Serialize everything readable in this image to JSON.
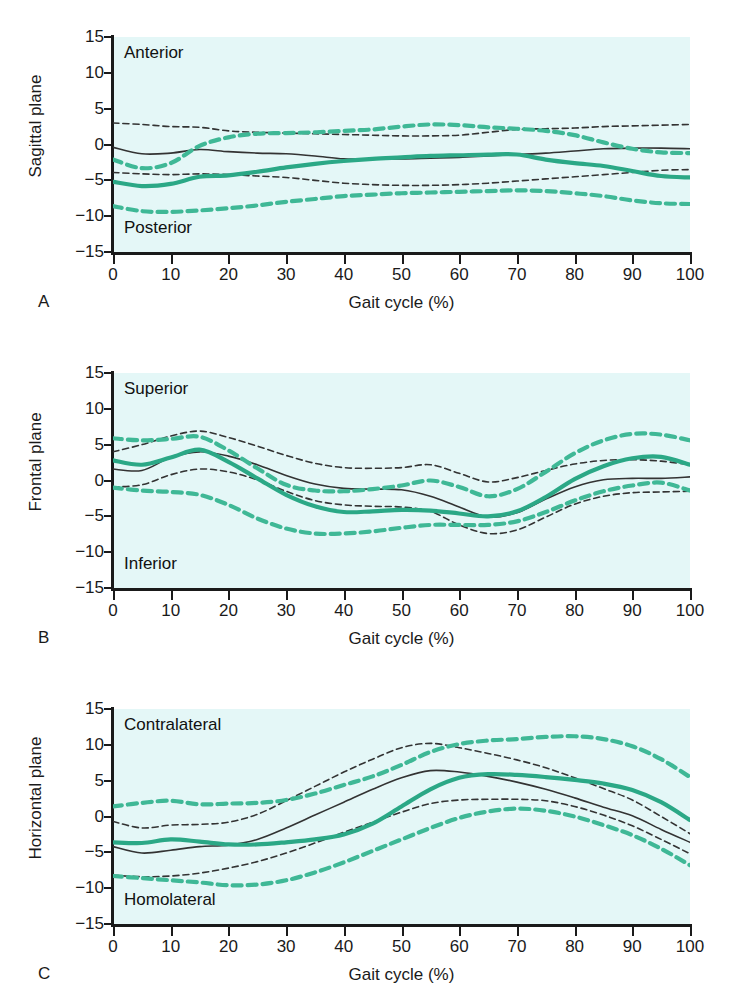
{
  "figure": {
    "xaxis_title": "Gait cycle (%)",
    "xticks": [
      0,
      10,
      20,
      30,
      40,
      50,
      60,
      70,
      80,
      90,
      100
    ],
    "yticks": [
      15,
      10,
      5,
      0,
      -5,
      -10,
      -15
    ],
    "ytick_labels": [
      "15",
      "10",
      "5",
      "0",
      "−5",
      "−10",
      "−15"
    ],
    "colors": {
      "plot_background": "#e4f7f7",
      "axis": "#1a1a1a",
      "normal_mean": "#333333",
      "normal_sd": "#333333",
      "patient_mean": "#2ba886",
      "patient_sd": "#3fb896"
    }
  },
  "panels": [
    {
      "letter": "A",
      "ylabel": "Sagittal plane",
      "corner_top": "Anterior",
      "corner_bottom": "Posterior",
      "xaxis_title": "Gait cycle (%)"
    },
    {
      "letter": "B",
      "ylabel": "Frontal plane",
      "corner_top": "Superior",
      "corner_bottom": "Inferior",
      "xaxis_title": "Gait cycle (%)"
    },
    {
      "letter": "C",
      "ylabel": "Horizontal plane",
      "corner_top": "Contralateral",
      "corner_bottom": "Homolateral",
      "xaxis_title": "Gait cycle (%)"
    }
  ],
  "chart_data": [
    {
      "type": "line",
      "panel": "A",
      "title": "Sagittal plane",
      "xlabel": "Gait cycle (%)",
      "ylabel": "Sagittal plane",
      "xlim": [
        0,
        100
      ],
      "ylim": [
        -15,
        15
      ],
      "grid": false,
      "legend": "none",
      "annotations": [
        "Anterior",
        "Posterior"
      ],
      "x": [
        0,
        5,
        10,
        15,
        20,
        25,
        30,
        35,
        40,
        45,
        50,
        55,
        60,
        65,
        70,
        75,
        80,
        85,
        90,
        95,
        100
      ],
      "series": [
        {
          "name": "normal-mean",
          "style": "solid",
          "color": "#333333",
          "values": [
            -0.4,
            -1.3,
            -1.2,
            -0.7,
            -1.0,
            -1.2,
            -1.3,
            -1.6,
            -2.0,
            -2.0,
            -2.0,
            -1.9,
            -1.8,
            -1.6,
            -1.4,
            -1.2,
            -0.9,
            -0.6,
            -0.5,
            -0.5,
            -0.6
          ]
        },
        {
          "name": "normal-sd-upper",
          "style": "dashed",
          "color": "#333333",
          "values": [
            3.0,
            2.8,
            2.5,
            2.4,
            1.9,
            1.7,
            1.6,
            1.5,
            1.4,
            1.3,
            1.2,
            1.2,
            1.3,
            1.7,
            2.1,
            2.2,
            2.3,
            2.5,
            2.6,
            2.7,
            2.8
          ]
        },
        {
          "name": "normal-sd-lower",
          "style": "dashed",
          "color": "#333333",
          "values": [
            -3.9,
            -4.1,
            -4.2,
            -4.1,
            -4.2,
            -4.4,
            -4.6,
            -5.0,
            -5.4,
            -5.6,
            -5.7,
            -5.7,
            -5.6,
            -5.4,
            -5.1,
            -4.8,
            -4.5,
            -4.2,
            -3.9,
            -3.6,
            -3.5
          ]
        },
        {
          "name": "patient-mean",
          "style": "solid",
          "color": "#2ba886",
          "values": [
            -5.2,
            -5.8,
            -5.5,
            -4.5,
            -4.3,
            -3.8,
            -3.2,
            -2.7,
            -2.3,
            -2.0,
            -1.8,
            -1.6,
            -1.5,
            -1.4,
            -1.4,
            -2.1,
            -2.6,
            -3.0,
            -3.7,
            -4.4,
            -4.6
          ]
        },
        {
          "name": "patient-sd-upper",
          "style": "dashed",
          "color": "#3fb896",
          "values": [
            -2.1,
            -3.3,
            -2.6,
            -0.2,
            1.0,
            1.5,
            1.6,
            1.7,
            1.9,
            2.1,
            2.5,
            2.8,
            2.7,
            2.4,
            2.2,
            1.9,
            1.3,
            0.3,
            -0.6,
            -1.1,
            -1.2
          ]
        },
        {
          "name": "patient-sd-lower",
          "style": "dashed",
          "color": "#3fb896",
          "values": [
            -8.6,
            -9.3,
            -9.4,
            -9.2,
            -8.9,
            -8.5,
            -8.0,
            -7.6,
            -7.2,
            -7.0,
            -6.8,
            -6.7,
            -6.6,
            -6.5,
            -6.4,
            -6.5,
            -6.8,
            -7.2,
            -7.8,
            -8.2,
            -8.3
          ]
        }
      ]
    },
    {
      "type": "line",
      "panel": "B",
      "title": "Frontal plane",
      "xlabel": "Gait cycle (%)",
      "ylabel": "Frontal plane",
      "xlim": [
        0,
        100
      ],
      "ylim": [
        -15,
        15
      ],
      "grid": false,
      "legend": "none",
      "annotations": [
        "Superior",
        "Inferior"
      ],
      "x": [
        0,
        5,
        10,
        15,
        20,
        25,
        30,
        35,
        40,
        45,
        50,
        55,
        60,
        65,
        70,
        75,
        80,
        85,
        90,
        95,
        100
      ],
      "series": [
        {
          "name": "normal-mean",
          "style": "solid",
          "color": "#333333",
          "values": [
            1.6,
            1.4,
            3.2,
            4.0,
            3.4,
            2.2,
            0.7,
            -0.5,
            -1.1,
            -1.2,
            -1.3,
            -2.2,
            -3.7,
            -5.1,
            -4.5,
            -2.6,
            -0.9,
            0.1,
            0.3,
            0.3,
            0.5
          ]
        },
        {
          "name": "normal-sd-upper",
          "style": "dashed",
          "color": "#333333",
          "values": [
            4.0,
            5.0,
            6.2,
            6.9,
            6.0,
            4.8,
            3.5,
            2.4,
            1.8,
            1.7,
            1.8,
            2.2,
            1.0,
            -0.2,
            0.4,
            1.4,
            2.3,
            2.8,
            2.9,
            2.7,
            2.2
          ]
        },
        {
          "name": "normal-sd-lower",
          "style": "dashed",
          "color": "#333333",
          "values": [
            -0.9,
            -0.6,
            0.8,
            1.6,
            1.2,
            0.1,
            -1.5,
            -2.8,
            -3.4,
            -3.6,
            -3.7,
            -4.3,
            -6.2,
            -7.4,
            -6.9,
            -5.1,
            -3.3,
            -2.2,
            -1.7,
            -1.6,
            -1.5
          ]
        },
        {
          "name": "patient-mean",
          "style": "solid",
          "color": "#2ba886",
          "values": [
            2.8,
            2.2,
            3.2,
            4.3,
            2.6,
            0.3,
            -2.0,
            -3.6,
            -4.4,
            -4.3,
            -4.1,
            -4.2,
            -4.6,
            -5.0,
            -4.3,
            -2.3,
            0.2,
            2.0,
            3.1,
            3.3,
            2.2
          ]
        },
        {
          "name": "patient-sd-upper",
          "style": "dashed",
          "color": "#3fb896",
          "values": [
            5.9,
            5.6,
            5.8,
            6.1,
            4.2,
            1.7,
            -0.6,
            -1.4,
            -1.5,
            -1.2,
            -0.7,
            0.0,
            -0.9,
            -2.2,
            -1.2,
            1.2,
            3.8,
            5.6,
            6.5,
            6.4,
            5.6
          ]
        },
        {
          "name": "patient-sd-lower",
          "style": "dashed",
          "color": "#3fb896",
          "values": [
            -1.0,
            -1.4,
            -1.6,
            -2.0,
            -3.4,
            -5.3,
            -6.7,
            -7.4,
            -7.4,
            -7.1,
            -6.6,
            -6.2,
            -6.2,
            -6.2,
            -5.7,
            -4.4,
            -2.8,
            -1.5,
            -0.7,
            -0.3,
            -1.4
          ]
        }
      ]
    },
    {
      "type": "line",
      "panel": "C",
      "title": "Horizontal plane",
      "xlabel": "Gait cycle (%)",
      "ylabel": "Horizontal plane",
      "xlim": [
        0,
        100
      ],
      "ylim": [
        -15,
        15
      ],
      "grid": false,
      "legend": "none",
      "annotations": [
        "Contralateral",
        "Homolateral"
      ],
      "x": [
        0,
        5,
        10,
        15,
        20,
        25,
        30,
        35,
        40,
        45,
        50,
        55,
        60,
        65,
        70,
        75,
        80,
        85,
        90,
        95,
        100
      ],
      "series": [
        {
          "name": "normal-mean",
          "style": "solid",
          "color": "#333333",
          "values": [
            -4.2,
            -5.1,
            -4.7,
            -4.2,
            -4.0,
            -3.2,
            -1.6,
            0.2,
            2.0,
            3.8,
            5.4,
            6.4,
            6.2,
            5.6,
            4.8,
            3.8,
            2.6,
            1.3,
            0.1,
            -1.8,
            -3.6
          ]
        },
        {
          "name": "normal-sd-upper",
          "style": "dashed",
          "color": "#333333",
          "values": [
            -0.7,
            -1.6,
            -1.2,
            -1.1,
            -0.8,
            0.3,
            2.2,
            4.2,
            6.2,
            8.0,
            9.6,
            10.2,
            9.6,
            8.8,
            7.9,
            6.8,
            5.4,
            3.9,
            2.3,
            0.0,
            -2.4
          ]
        },
        {
          "name": "normal-sd-lower",
          "style": "dashed",
          "color": "#333333",
          "values": [
            -8.2,
            -8.4,
            -8.3,
            -7.9,
            -7.2,
            -6.3,
            -5.1,
            -3.7,
            -2.2,
            -0.8,
            0.6,
            1.8,
            2.3,
            2.4,
            2.4,
            2.2,
            1.4,
            0.2,
            -1.3,
            -3.2,
            -5.2
          ]
        },
        {
          "name": "patient-mean",
          "style": "solid",
          "color": "#2ba886",
          "values": [
            -3.6,
            -3.7,
            -3.2,
            -3.5,
            -3.9,
            -3.9,
            -3.6,
            -3.2,
            -2.5,
            -1.0,
            1.4,
            3.8,
            5.4,
            5.9,
            5.8,
            5.5,
            5.1,
            4.6,
            3.7,
            2.0,
            -0.5
          ]
        },
        {
          "name": "patient-sd-upper",
          "style": "dashed",
          "color": "#3fb896",
          "values": [
            1.4,
            1.9,
            2.2,
            1.7,
            1.8,
            1.9,
            2.3,
            3.2,
            4.4,
            5.6,
            7.2,
            9.0,
            10.1,
            10.6,
            10.8,
            11.1,
            11.2,
            10.8,
            9.8,
            8.0,
            5.5
          ]
        },
        {
          "name": "patient-sd-lower",
          "style": "dashed",
          "color": "#3fb896",
          "values": [
            -8.3,
            -8.6,
            -8.9,
            -9.2,
            -9.6,
            -9.5,
            -8.9,
            -7.8,
            -6.4,
            -4.8,
            -3.2,
            -1.6,
            -0.2,
            0.7,
            1.1,
            0.8,
            0.0,
            -1.2,
            -2.6,
            -4.5,
            -6.8
          ]
        }
      ]
    }
  ]
}
